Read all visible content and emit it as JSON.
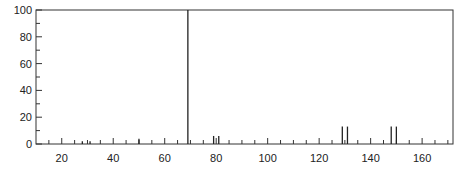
{
  "chart_data": {
    "type": "bar",
    "title": "",
    "xlabel": "",
    "ylabel": "",
    "xlim": [
      10,
      172
    ],
    "ylim": [
      0,
      100
    ],
    "grid": false,
    "x_ticks": [
      20,
      40,
      60,
      80,
      100,
      120,
      140,
      160
    ],
    "y_ticks": [
      0,
      20,
      40,
      60,
      80,
      100
    ],
    "x": [
      28,
      31,
      50,
      69,
      79,
      81,
      129,
      131,
      148,
      150
    ],
    "values": [
      2,
      2,
      4,
      100,
      6,
      6,
      13,
      13,
      13,
      13
    ]
  }
}
